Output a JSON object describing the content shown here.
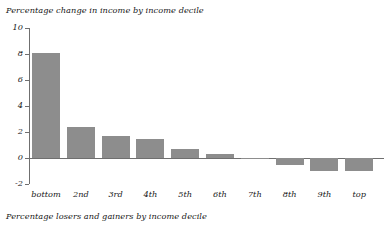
{
  "chart_data": {
    "type": "bar",
    "title": "Percentage change in income by income decile",
    "caption": "Percentage losers and gainers by income decile",
    "xlabel": "",
    "ylabel": "",
    "categories": [
      "bottom",
      "2nd",
      "3rd",
      "4th",
      "5th",
      "6th",
      "7th",
      "8th",
      "9th",
      "top"
    ],
    "values": [
      8.1,
      2.4,
      1.7,
      1.5,
      0.7,
      0.3,
      -0.1,
      -0.5,
      -1.0,
      -1.0
    ],
    "ylim": [
      -2,
      10
    ],
    "yticks": [
      10,
      8,
      6,
      4,
      2,
      0,
      -2
    ],
    "ytick_labels": [
      "10",
      "8",
      "6",
      "4",
      "2",
      "0",
      "-2"
    ],
    "grid": false,
    "legend": false,
    "bar_color": "#8d8d8d",
    "axis_color": "#6f6f6f"
  }
}
